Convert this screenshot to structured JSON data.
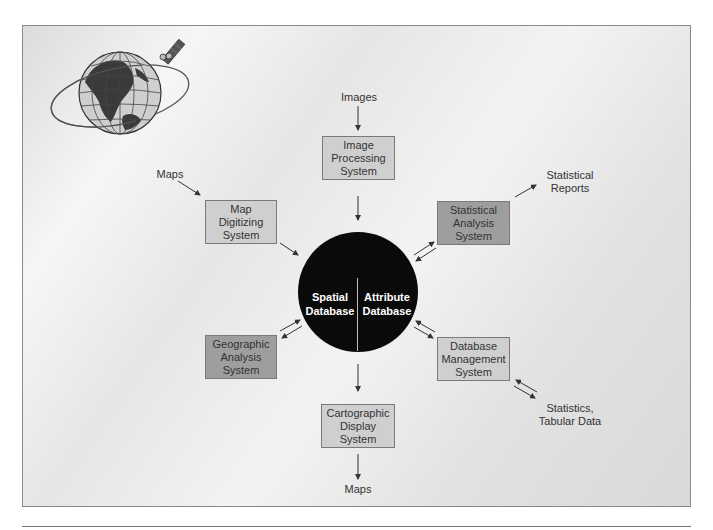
{
  "diagram": {
    "center": {
      "left_label": "Spatial\nDatabase",
      "right_label": "Attribute\nDatabase"
    },
    "boxes": {
      "image_processing": "Image\nProcessing\nSystem",
      "map_digitizing": "Map\nDigitizing\nSystem",
      "statistical_analysis": "Statistical\nAnalysis\nSystem",
      "geographic_analysis": "Geographic\nAnalysis\nSystem",
      "database_management": "Database\nManagement\nSystem",
      "cartographic_display": "Cartographic\nDisplay\nSystem"
    },
    "io_labels": {
      "images": "Images",
      "maps_in": "Maps",
      "statistical_reports": "Statistical\nReports",
      "statistics_tabular": "Statistics,\nTabular Data",
      "maps_out": "Maps"
    },
    "colors": {
      "light_box": "#cfcfcf",
      "dark_box": "#9e9e9e",
      "center_circle": "#0a0a0a",
      "arrow": "#333333"
    },
    "icons": {
      "globe": "globe-with-orbit-icon",
      "satellite": "satellite-icon"
    }
  }
}
